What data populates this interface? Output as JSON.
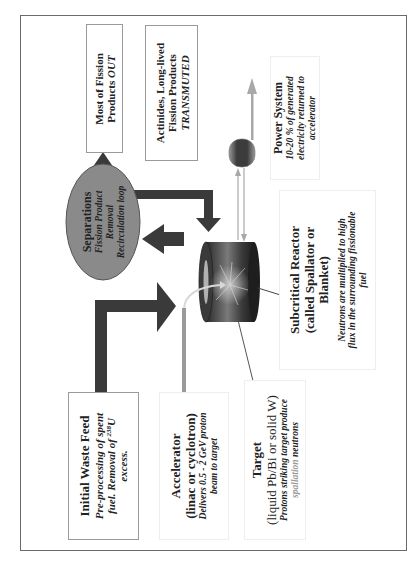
{
  "diagram": {
    "orientation": "rotated -90deg (text reads bottom-to-top)",
    "colors": {
      "frame": "#6a6a6a",
      "dark_arrow": "#3a3a3a",
      "separations_fill": "#8a8a8a",
      "reactor_dark": "#2e2e2e",
      "reactor_light": "#8c8c8c",
      "beam_line": "#9a9a9a",
      "power_lines": "#a8a8a8",
      "spallation_text": "#9a9a9a"
    },
    "boxes": {
      "fission_out": {
        "line1": "Most of Fission",
        "line2_prefix": "Products ",
        "line2_emph": "OUT"
      },
      "transmuted": {
        "line1": "Actinides, Long-lived",
        "line2": "Fission Products",
        "line3": "TRANSMUTED"
      },
      "separations": {
        "title": "Separations",
        "line1": "Fission Product",
        "line2": "Removal",
        "line3": "Recirculation loop"
      },
      "power_system": {
        "title": "Power System",
        "line1": "10-20 % of generated",
        "line2": "electricity returned to",
        "line3": "accelerator"
      },
      "subcritical": {
        "title1": "Subcritical Reactor",
        "title2": "(called Spallator or",
        "title3": "Blanket)",
        "desc1": "Neutrons are multiplied to high",
        "desc2": "flux in the surrounding fissionable",
        "desc3": "fuel"
      },
      "waste_feed": {
        "title": "Initial Waste Feed",
        "line1": "Pre-processing of spent",
        "line2_prefix": "fuel. Removal of ",
        "line2_sup": "238",
        "line2_suffix": "U",
        "line3": "excess."
      },
      "accelerator": {
        "title": "Accelerator",
        "subtitle": "(linac or cyclotron)",
        "line1": "Delivers 0.5 - 2 GeV proton",
        "line2": "beam to target"
      },
      "target": {
        "title": "Target",
        "subtitle": "(liquid Pb/Bi or solid W)",
        "line1": "Protons striking target produce",
        "line2_emph": "spallation",
        "line2_suffix": " neutrons"
      }
    }
  }
}
